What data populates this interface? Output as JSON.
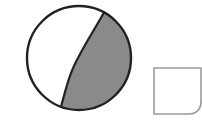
{
  "diagram": {
    "colors": {
      "background": "#ffffff",
      "circle_outline": "#222222",
      "shaded_fill": "#8a8a8a",
      "unshaded_fill": "#ffffff",
      "square_outline": "#9a9a9a"
    },
    "circle": {
      "cx": 79,
      "cy": 58,
      "r": 52,
      "shaded_side": "right"
    },
    "square": {
      "x": 154,
      "y": 68,
      "width": 47,
      "height": 46,
      "rounded_corner": "bottom-right",
      "corner_radius": 13
    }
  }
}
